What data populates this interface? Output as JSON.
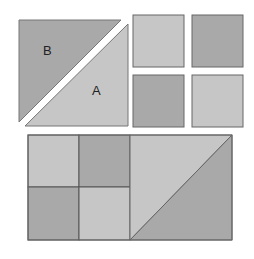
{
  "diagram": {
    "width": 254,
    "height": 259,
    "background": "#ffffff",
    "stroke": "#555555",
    "colors": {
      "dark": "#a9a9a9",
      "light": "#c6c6c6"
    },
    "top_left_square": {
      "triangle_b": {
        "label": "B",
        "points": "19,20 121,20 19,122",
        "fill": "#a9a9a9",
        "label_x": 43,
        "label_y": 55
      },
      "triangle_a": {
        "label": "A",
        "points": "128,24 128,126 25,126",
        "fill": "#c6c6c6",
        "label_x": 92,
        "label_y": 95
      }
    },
    "small_squares": [
      {
        "name": "small-square-top-left",
        "x": 133,
        "y": 15,
        "w": 51,
        "h": 52,
        "fill": "#c6c6c6"
      },
      {
        "name": "small-square-top-right",
        "x": 192,
        "y": 15,
        "w": 51,
        "h": 52,
        "fill": "#a9a9a9"
      },
      {
        "name": "small-square-bottom-left",
        "x": 133,
        "y": 75,
        "w": 51,
        "h": 52,
        "fill": "#a9a9a9"
      },
      {
        "name": "small-square-bottom-right",
        "x": 192,
        "y": 75,
        "w": 51,
        "h": 52,
        "fill": "#c6c6c6"
      }
    ],
    "bottom_rectangle": {
      "x": 28,
      "y": 135,
      "w": 204,
      "h": 105,
      "cells": [
        {
          "name": "cell-top-left",
          "x": 28,
          "y": 135,
          "w": 51,
          "h": 52,
          "fill": "#c6c6c6"
        },
        {
          "name": "cell-top-right",
          "x": 79,
          "y": 135,
          "w": 51,
          "h": 52,
          "fill": "#a9a9a9"
        },
        {
          "name": "cell-bottom-left",
          "x": 28,
          "y": 187,
          "w": 51,
          "h": 53,
          "fill": "#a9a9a9"
        },
        {
          "name": "cell-bottom-right",
          "x": 79,
          "y": 187,
          "w": 51,
          "h": 53,
          "fill": "#c6c6c6"
        }
      ],
      "triangle_upper": {
        "points": "130,135 232,135 130,240",
        "fill": "#c6c6c6"
      },
      "triangle_lower": {
        "points": "232,135 232,240 130,240",
        "fill": "#a9a9a9"
      }
    }
  }
}
